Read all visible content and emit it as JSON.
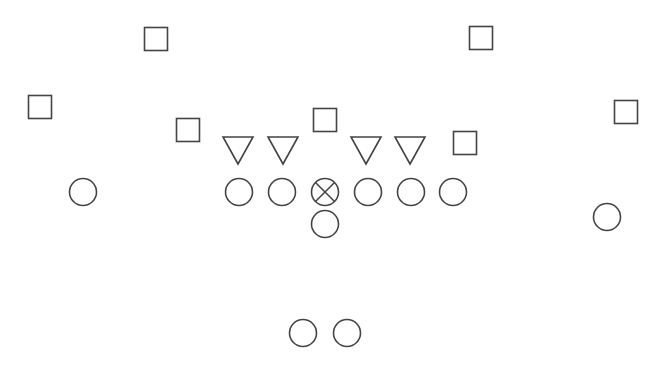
{
  "diagram": {
    "type": "football-formation",
    "stroke_color": "#444444",
    "background": "#ffffff",
    "defense_squares": [
      {
        "id": "sq1",
        "x": 156,
        "y": 39
      },
      {
        "id": "sq2",
        "x": 40,
        "y": 107
      },
      {
        "id": "sq3",
        "x": 188,
        "y": 130
      },
      {
        "id": "sq4",
        "x": 325,
        "y": 120
      },
      {
        "id": "sq5",
        "x": 481,
        "y": 38
      },
      {
        "id": "sq6",
        "x": 465,
        "y": 143
      },
      {
        "id": "sq7",
        "x": 626,
        "y": 112
      }
    ],
    "defense_triangles": [
      {
        "id": "tri1",
        "x": 238,
        "y": 150
      },
      {
        "id": "tri2",
        "x": 283,
        "y": 150
      },
      {
        "id": "tri3",
        "x": 366,
        "y": 150
      },
      {
        "id": "tri4",
        "x": 410,
        "y": 150
      }
    ],
    "offense_circles": [
      {
        "id": "wr-left",
        "x": 83,
        "y": 192
      },
      {
        "id": "lt",
        "x": 239,
        "y": 192
      },
      {
        "id": "lg",
        "x": 282,
        "y": 192
      },
      {
        "id": "rg",
        "x": 368,
        "y": 192
      },
      {
        "id": "rt",
        "x": 411,
        "y": 192
      },
      {
        "id": "te",
        "x": 453,
        "y": 192
      },
      {
        "id": "qb",
        "x": 325,
        "y": 224
      },
      {
        "id": "wr-right",
        "x": 607,
        "y": 217
      },
      {
        "id": "rb-left",
        "x": 303,
        "y": 333
      },
      {
        "id": "rb-right",
        "x": 347,
        "y": 333
      }
    ],
    "center": {
      "id": "center",
      "x": 325,
      "y": 192,
      "marker": "x-circle"
    }
  }
}
